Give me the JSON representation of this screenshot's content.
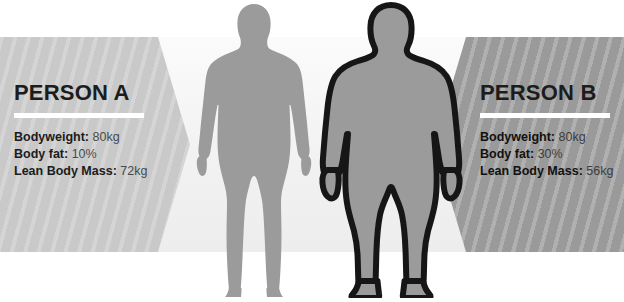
{
  "infographic": {
    "title_hidden": "",
    "panels": [
      {
        "id": "person-a",
        "heading": "PERSON A",
        "panel_color": "#c9c9c9",
        "stats": [
          {
            "label": "Bodyweight:",
            "value": "80kg"
          },
          {
            "label": "Body fat:",
            "value": "10%"
          },
          {
            "label": "Lean Body Mass:",
            "value": "72kg"
          }
        ]
      },
      {
        "id": "person-b",
        "heading": "PERSON B",
        "panel_color": "#9a9a9a",
        "stats": [
          {
            "label": "Bodyweight:",
            "value": "80kg"
          },
          {
            "label": "Body fat:",
            "value": "30%"
          },
          {
            "label": "Lean Body Mass:",
            "value": "56kg"
          }
        ]
      }
    ],
    "figures": [
      {
        "id": "figure-lean",
        "name": "lean-body-silhouette",
        "fill": "#9b9b9b",
        "outline": "none"
      },
      {
        "id": "figure-obese",
        "name": "obese-body-silhouette",
        "fill": "#9b9b9b",
        "outline": "#161616"
      }
    ],
    "colors": {
      "background": "#ffffff",
      "center_band": "#f2f2f2",
      "heading_text": "#1c1c1c",
      "value_text": "#4a4a4a",
      "rule": "#ffffff"
    }
  }
}
